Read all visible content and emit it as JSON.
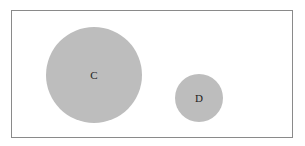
{
  "diagram": {
    "frame": {
      "x": 11,
      "y": 10,
      "width": 281,
      "height": 127,
      "stroke": "#8a8a8a"
    },
    "circles": [
      {
        "label": "C",
        "cx": 94,
        "cy": 75,
        "r": 48,
        "fill": "#bdbdbd"
      },
      {
        "label": "D",
        "cx": 199,
        "cy": 98,
        "r": 24,
        "fill": "#bdbdbd"
      }
    ]
  }
}
